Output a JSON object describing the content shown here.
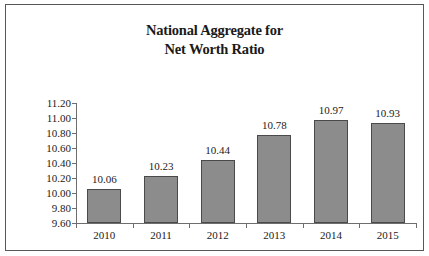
{
  "chart_data": {
    "type": "bar",
    "title": "National Aggregate for Net Worth Ratio",
    "title_lines": [
      "National Aggregate for",
      "Net Worth Ratio"
    ],
    "categories": [
      "2010",
      "2011",
      "2012",
      "2013",
      "2014",
      "2015"
    ],
    "values": [
      10.06,
      10.23,
      10.44,
      10.78,
      10.97,
      10.93
    ],
    "data_labels": [
      "10.06",
      "10.23",
      "10.44",
      "10.78",
      "10.97",
      "10.93"
    ],
    "xlabel": "",
    "ylabel": "",
    "ylim": [
      9.6,
      11.2
    ],
    "ytick_labels": [
      "11.20",
      "11.00",
      "10.80",
      "10.60",
      "10.40",
      "10.20",
      "10.00",
      "9.80",
      "9.60"
    ],
    "ytick_values": [
      11.2,
      11.0,
      10.8,
      10.6,
      10.4,
      10.2,
      10.0,
      9.8,
      9.6
    ],
    "ytick_step": 0.2,
    "grid": false,
    "legend": null,
    "series_color": "#8c8c8c",
    "series_border_color": "#4a4a4a",
    "axis_color": "#6e6e6e",
    "text_color": "#1a1a1a",
    "background_color": "#ffffff",
    "frame_color": "#585858"
  }
}
